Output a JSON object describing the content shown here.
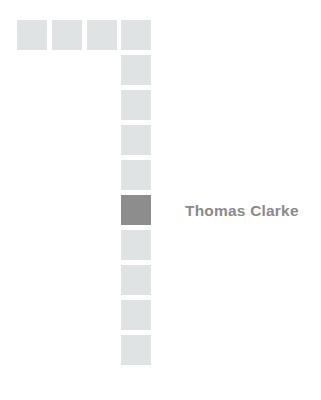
{
  "figure": {
    "kind": "pictogram-grid",
    "background_color": "#ffffff",
    "width": 321,
    "height": 400,
    "cell": {
      "size": 30,
      "pitch": 35,
      "default_color": "#dfe3e4",
      "highlight_color": "#8d8d8d"
    },
    "origin": {
      "x": 17,
      "y": 20
    }
  },
  "label": {
    "text": "Thomas Clarke",
    "color": "#8a8a8a",
    "x": 185,
    "y": 211
  },
  "chart_data": {
    "type": "heatmap",
    "title": "",
    "xlabel": "",
    "ylabel": "",
    "grid": false,
    "legend": false,
    "columns": [
      0,
      1,
      2,
      3
    ],
    "rows": [
      0,
      1,
      2,
      3,
      4,
      5,
      6,
      7,
      8,
      9
    ],
    "cells": [
      {
        "name": "cell-r0-c0",
        "col": 0,
        "row": 0,
        "x": 17,
        "y": 20,
        "value": 0,
        "color": "#dfe3e4"
      },
      {
        "name": "cell-r0-c1",
        "col": 1,
        "row": 0,
        "x": 52,
        "y": 20,
        "value": 0,
        "color": "#dfe3e4"
      },
      {
        "name": "cell-r0-c2",
        "col": 2,
        "row": 0,
        "x": 87,
        "y": 20,
        "value": 0,
        "color": "#dfe3e4"
      },
      {
        "name": "cell-r0-c3",
        "col": 3,
        "row": 0,
        "x": 121,
        "y": 20,
        "value": 0,
        "color": "#dfe3e4"
      },
      {
        "name": "cell-r1-c3",
        "col": 3,
        "row": 1,
        "x": 121,
        "y": 55,
        "value": 0,
        "color": "#dfe3e4"
      },
      {
        "name": "cell-r2-c3",
        "col": 3,
        "row": 2,
        "x": 121,
        "y": 90,
        "value": 0,
        "color": "#dfe3e4"
      },
      {
        "name": "cell-r3-c3",
        "col": 3,
        "row": 3,
        "x": 121,
        "y": 125,
        "value": 0,
        "color": "#dfe3e4"
      },
      {
        "name": "cell-r4-c3",
        "col": 3,
        "row": 4,
        "x": 121,
        "y": 160,
        "value": 0,
        "color": "#dfe3e4"
      },
      {
        "name": "cell-r5-c3",
        "col": 3,
        "row": 5,
        "x": 121,
        "y": 195,
        "value": 1,
        "color": "#8d8d8d"
      },
      {
        "name": "cell-r6-c3",
        "col": 3,
        "row": 6,
        "x": 121,
        "y": 230,
        "value": 0,
        "color": "#dfe3e4"
      },
      {
        "name": "cell-r7-c3",
        "col": 3,
        "row": 7,
        "x": 121,
        "y": 265,
        "value": 0,
        "color": "#dfe3e4"
      },
      {
        "name": "cell-r8-c3",
        "col": 3,
        "row": 8,
        "x": 121,
        "y": 300,
        "value": 0,
        "color": "#dfe3e4"
      },
      {
        "name": "cell-r9-c3",
        "col": 3,
        "row": 9,
        "x": 121,
        "y": 335,
        "value": 0,
        "color": "#dfe3e4"
      }
    ],
    "annotations": [
      {
        "text": "Thomas Clarke",
        "x": 185,
        "y": 211,
        "target_cell": "cell-r5-c3"
      }
    ]
  }
}
